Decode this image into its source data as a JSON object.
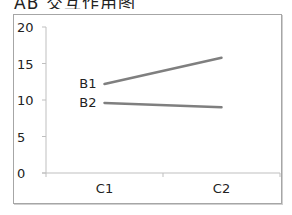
{
  "title": "AB 交互作用图",
  "chart_data": {
    "type": "line",
    "title": "AB 交互作用图",
    "categories": [
      "C1",
      "C2"
    ],
    "series": [
      {
        "name": "B1",
        "values": [
          12.2,
          15.8
        ],
        "color": "#7f7f7f"
      },
      {
        "name": "B2",
        "values": [
          9.6,
          9.0
        ],
        "color": "#7f7f7f"
      }
    ],
    "xlabel": "",
    "ylabel": "",
    "ylim": [
      0,
      20
    ],
    "yticks": [
      0,
      5,
      10,
      15,
      20
    ],
    "ytick_labels": [
      "0",
      "5",
      "10",
      "15",
      "20"
    ],
    "grid": false,
    "legend": "inline labels at left end of each line"
  }
}
